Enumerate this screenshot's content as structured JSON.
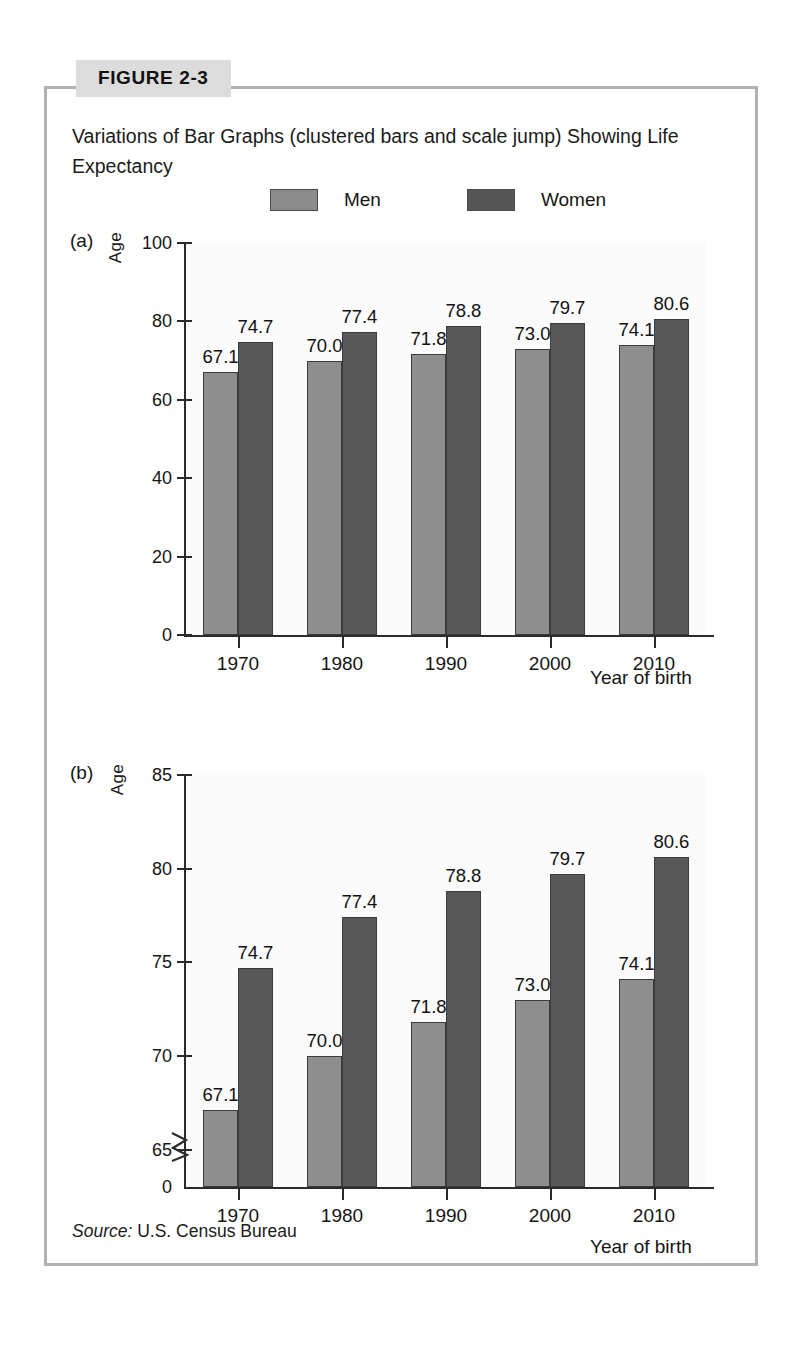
{
  "figure": {
    "badge": "FIGURE 2-3",
    "caption": "Variations of Bar Graphs (clustered bars and scale jump) Showing Life Expectancy",
    "source_prefix": "Source:",
    "source_text": "U.S. Census Bureau"
  },
  "legend": {
    "entries": [
      {
        "label": "Men",
        "color": "#8e8e8e"
      },
      {
        "label": "Women",
        "color": "#585858"
      }
    ]
  },
  "panels": [
    {
      "letter": "(a)"
    },
    {
      "letter": "(b)"
    }
  ],
  "chart_data": [
    {
      "type": "bar",
      "panel": "(a)",
      "title": "",
      "xlabel": "Year of birth",
      "ylabel": "Age",
      "categories": [
        "1970",
        "1980",
        "1990",
        "2000",
        "2010"
      ],
      "series": [
        {
          "name": "Men",
          "values": [
            67.1,
            70.0,
            71.8,
            73.0,
            74.1
          ]
        },
        {
          "name": "Women",
          "values": [
            74.7,
            77.4,
            78.8,
            79.7,
            80.6
          ]
        }
      ],
      "ylim": [
        0,
        100
      ],
      "yticks": [
        0,
        20,
        40,
        60,
        80,
        100
      ],
      "ytick_labels": [
        "0",
        "20",
        "40",
        "60",
        "80",
        "100"
      ],
      "grid": false,
      "scale_jump": false,
      "legend_position": "top-center"
    },
    {
      "type": "bar",
      "panel": "(b)",
      "title": "",
      "xlabel": "Year of birth",
      "ylabel": "Age",
      "categories": [
        "1970",
        "1980",
        "1990",
        "2000",
        "2010"
      ],
      "series": [
        {
          "name": "Men",
          "values": [
            67.1,
            70.0,
            71.8,
            73.0,
            74.1
          ]
        },
        {
          "name": "Women",
          "values": [
            74.7,
            77.4,
            78.8,
            79.7,
            80.6
          ]
        }
      ],
      "ylim": [
        63,
        85
      ],
      "yticks": [
        65,
        70,
        75,
        80,
        85
      ],
      "ytick_labels": [
        "65",
        "70",
        "75",
        "80",
        "85"
      ],
      "baseline_label": "0",
      "grid": false,
      "scale_jump": true,
      "legend_position": "top-center"
    }
  ]
}
